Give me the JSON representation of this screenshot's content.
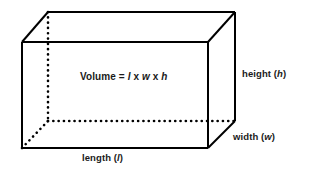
{
  "figure": {
    "name": "rectangular-prism-volume-diagram",
    "background_color": "#ffffff",
    "line_color": "#000000",
    "text_color": "#1a1a1a"
  },
  "formula": {
    "lead": "Volume = ",
    "length_var": "l",
    "times_1": " x ",
    "width_var": "w",
    "times_2": " x ",
    "height_var": "h"
  },
  "labels": {
    "height": {
      "text": "height (",
      "var": "h",
      "close": ")"
    },
    "width": {
      "text": "width (",
      "var": "w",
      "close": ")"
    },
    "length": {
      "text": "length (",
      "var": "l",
      "close": ")"
    }
  },
  "geometry": {
    "front_face": {
      "top_left": [
        22,
        42
      ],
      "top_right": [
        208,
        42
      ],
      "bottom_right": [
        208,
        148
      ],
      "bottom_left": [
        22,
        148
      ]
    },
    "back_face": {
      "top_left": [
        48,
        12
      ],
      "top_right": [
        235,
        12
      ],
      "bottom_right": [
        235,
        121
      ],
      "bottom_left": [
        48,
        121
      ]
    },
    "hidden_edges": [
      "back-bottom-left-vertical",
      "back-bottom-horizontal",
      "back-bottom-left-diagonal"
    ],
    "stroke_width": 2,
    "dot_radius": 1.3
  }
}
